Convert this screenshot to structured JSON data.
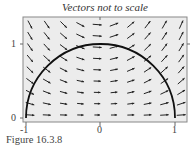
{
  "figure": {
    "title": "Vectors not to scale",
    "caption": "Figure 16.3.8"
  },
  "chart_data": {
    "type": "vector_field",
    "title": "Vectors not to scale",
    "xlabel": "",
    "ylabel": "",
    "xlim": [
      -1,
      1
    ],
    "ylim": [
      0,
      1.3
    ],
    "x_ticks": [
      "-1",
      "0",
      "1"
    ],
    "y_ticks": [
      "0",
      "1"
    ],
    "curve": {
      "name": "upper unit semicircle",
      "equation": "x^2 + y^2 = 1, y >= 0"
    },
    "field_description": "Arrows nearly horizontal pointing right near y=0; in upper-left they slope downward to the right, in upper-right they slope upward to the right",
    "colors": {
      "background": "#ececec",
      "arrow": "#222222",
      "curve": "#111111",
      "frame": "#888888"
    }
  },
  "axes": {
    "x_tick_labels": [
      "-1",
      "0",
      "1"
    ],
    "y_tick_labels": [
      "0",
      "1"
    ]
  }
}
